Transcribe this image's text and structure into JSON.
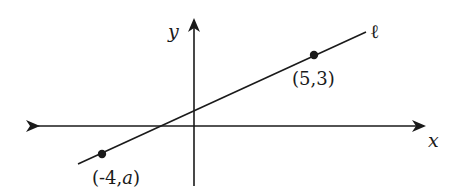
{
  "diagram": {
    "type": "coordinate-plane-line",
    "axes": {
      "x_label": "x",
      "y_label": "y",
      "color": "#1a1a1a"
    },
    "line": {
      "label": "ℓ",
      "color": "#1a1a1a"
    },
    "points": [
      {
        "label_open": "(",
        "label_x": "5",
        "label_sep": ",",
        "label_y": "3",
        "label_close": ")",
        "full_label": "(5,3)"
      },
      {
        "label_open": "(",
        "label_x": "-4",
        "label_sep": ",",
        "label_y": "a",
        "label_close": ")",
        "full_label": "(-4,a)"
      }
    ]
  }
}
